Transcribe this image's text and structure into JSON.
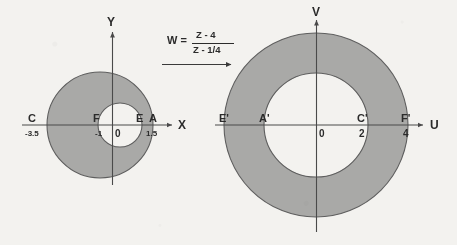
{
  "figure": {
    "background_color": "#f3f2ef",
    "ring_fill_color": "#a9a9a7",
    "hole_fill_color": "#f3f2ef",
    "stroke_color": "#5e5e5e"
  },
  "transform": {
    "name": "mobius-transform",
    "lhs": "W =",
    "numerator": "Z - 4",
    "denominator": "Z - 1/4",
    "arrow": "right-arrow"
  },
  "z_plane": {
    "name": "z-plane",
    "x_axis_label": "X",
    "y_axis_label": "Y",
    "origin_label": "0",
    "points": [
      {
        "label": "C",
        "value": "-3.5"
      },
      {
        "label": "F",
        "value": "-1"
      },
      {
        "label": "E",
        "value": ""
      },
      {
        "label": "A",
        "value": "1.5"
      }
    ],
    "shape": {
      "type": "annulus",
      "outer_label": "outer-circle",
      "inner_label": "inner-circle"
    }
  },
  "w_plane": {
    "name": "w-plane",
    "x_axis_label": "U",
    "y_axis_label": "V",
    "origin_label": "0",
    "points": [
      {
        "label": "E'",
        "value": ""
      },
      {
        "label": "A'",
        "value": ""
      },
      {
        "label": "C'",
        "value": "2"
      },
      {
        "label": "F'",
        "value": "4"
      }
    ],
    "shape": {
      "type": "annulus",
      "outer_label": "outer-circle",
      "inner_label": "inner-circle"
    }
  }
}
